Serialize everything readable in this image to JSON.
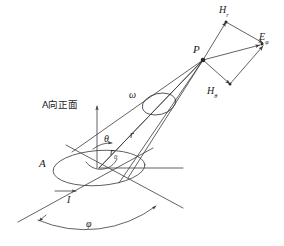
{
  "figure": {
    "background": "#ffffff",
    "stroke_color": "#3b3b3b",
    "text_color": "#1a1a1a",
    "width": 284,
    "height": 246
  },
  "labels": {
    "point_p": "P",
    "h_r": "H",
    "h_r_sub": "r",
    "h_theta": "H",
    "h_theta_sub": "θ",
    "e_phi": "E",
    "e_phi_sub": "φ",
    "omega": "ω",
    "theta": "θ",
    "r": "r",
    "r0": "r",
    "r0_sub": "0",
    "area_a": "A",
    "current_i": "I",
    "phi": "φ",
    "front_view": "A向正面"
  },
  "geometry": {
    "p_point": [
      203,
      60
    ],
    "loop_center": [
      99,
      168
    ],
    "loop_rx": 46,
    "loop_ry": 17,
    "omega_ellipse_center": [
      159,
      104
    ],
    "omega_ellipse_rx": 17,
    "omega_ellipse_ry": 10,
    "vertical_axis": [
      97,
      103,
      97,
      168
    ],
    "horizontal_axis": [
      99,
      168,
      183,
      168
    ],
    "vector_hr": [
      228,
      19
    ],
    "vector_htheta": [
      232,
      86
    ],
    "vector_ephi": [
      263,
      44
    ],
    "phi_arc_start": [
      40,
      222
    ],
    "phi_arc_end": [
      155,
      207
    ]
  }
}
